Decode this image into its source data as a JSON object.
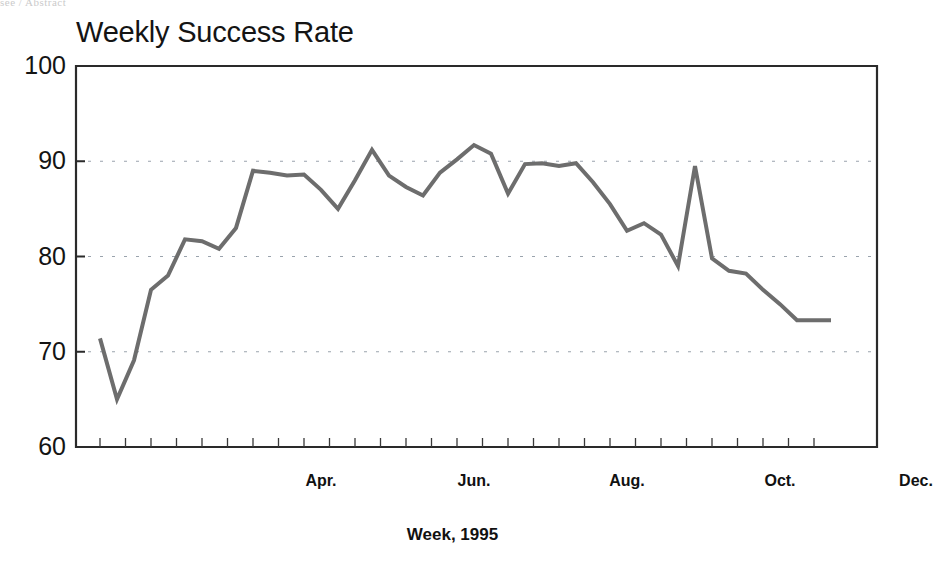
{
  "page": {
    "scan_artifact_text": "see / Abstract"
  },
  "chart_data": {
    "type": "line",
    "title": "Weekly Success Rate",
    "xlabel": "Week, 1995",
    "ylabel": "",
    "ylim": [
      60,
      100
    ],
    "ytick_values": [
      100,
      90,
      80,
      70,
      60
    ],
    "ytick_labels": [
      "100",
      "90",
      "80",
      "70",
      "60"
    ],
    "gridlines": {
      "horizontal_dashed_at": [
        90,
        80,
        70
      ],
      "vertical": false
    },
    "xlim": [
      1,
      52
    ],
    "xtick_labels": [
      "Apr.",
      "Jun.",
      "Aug.",
      "Oct.",
      "Dec."
    ],
    "xtick_positions_week": [
      14,
      23,
      32,
      41,
      49
    ],
    "minor_tick_interval_weeks": 1.5,
    "line_color": "#6d6d6d",
    "line_width": 4,
    "series": [
      {
        "name": "Weekly Success Rate",
        "x": [
          1,
          2,
          3,
          4,
          5,
          6,
          7,
          8,
          9,
          10,
          11,
          12,
          13,
          14,
          15,
          16,
          17,
          18,
          19,
          20,
          21,
          22,
          23,
          24,
          25,
          26,
          27,
          28,
          29,
          30,
          31,
          32,
          33,
          34,
          35,
          36,
          37,
          38,
          39,
          40,
          41,
          42,
          43,
          44
        ],
        "values": [
          71.4,
          65.0,
          69.1,
          76.5,
          78.0,
          81.8,
          81.6,
          80.8,
          83.0,
          89.0,
          88.8,
          88.5,
          88.6,
          87.0,
          85.0,
          88.0,
          91.2,
          88.5,
          87.3,
          86.4,
          88.8,
          90.2,
          91.7,
          90.8,
          86.6,
          89.7,
          89.8,
          89.5,
          89.8,
          87.8,
          85.5,
          82.7,
          83.5,
          82.3,
          79.0,
          89.5,
          79.8,
          78.5,
          78.2,
          76.5,
          75.0,
          73.3,
          73.3,
          73.3
        ]
      }
    ]
  }
}
